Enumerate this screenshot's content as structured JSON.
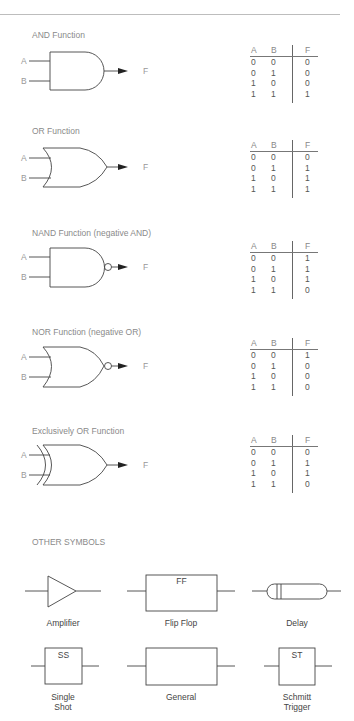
{
  "gates": [
    {
      "id": "and",
      "title": "AND Function",
      "input_a": "A",
      "input_b": "B",
      "output": "F",
      "table": {
        "headers": [
          "A",
          "B",
          "F"
        ],
        "rows": [
          [
            "0",
            "0",
            "0"
          ],
          [
            "0",
            "1",
            "0"
          ],
          [
            "1",
            "0",
            "0"
          ],
          [
            "1",
            "1",
            "1"
          ]
        ]
      }
    },
    {
      "id": "or",
      "title": "OR Function",
      "input_a": "A",
      "input_b": "B",
      "output": "F",
      "table": {
        "headers": [
          "A",
          "B",
          "F"
        ],
        "rows": [
          [
            "0",
            "0",
            "0"
          ],
          [
            "0",
            "1",
            "1"
          ],
          [
            "1",
            "0",
            "1"
          ],
          [
            "1",
            "1",
            "1"
          ]
        ]
      }
    },
    {
      "id": "nand",
      "title": "NAND Function (negative AND)",
      "input_a": "A",
      "input_b": "B",
      "output": "F",
      "table": {
        "headers": [
          "A",
          "B",
          "F"
        ],
        "rows": [
          [
            "0",
            "0",
            "1"
          ],
          [
            "0",
            "1",
            "1"
          ],
          [
            "1",
            "0",
            "1"
          ],
          [
            "1",
            "1",
            "0"
          ]
        ]
      }
    },
    {
      "id": "nor",
      "title": "NOR Function (negative OR)",
      "input_a": "A",
      "input_b": "B",
      "output": "F",
      "table": {
        "headers": [
          "A",
          "B",
          "F"
        ],
        "rows": [
          [
            "0",
            "0",
            "1"
          ],
          [
            "0",
            "1",
            "0"
          ],
          [
            "1",
            "0",
            "0"
          ],
          [
            "1",
            "1",
            "0"
          ]
        ]
      }
    },
    {
      "id": "xor",
      "title": "Exclusively OR Function",
      "input_a": "A",
      "input_b": "B",
      "output": "F",
      "table": {
        "headers": [
          "A",
          "B",
          "F"
        ],
        "rows": [
          [
            "0",
            "0",
            "0"
          ],
          [
            "0",
            "1",
            "1"
          ],
          [
            "1",
            "0",
            "1"
          ],
          [
            "1",
            "1",
            "0"
          ]
        ]
      }
    }
  ],
  "other": {
    "title": "OTHER SYMBOLS",
    "symbols": [
      {
        "id": "amplifier",
        "label": "Amplifier",
        "inner": ""
      },
      {
        "id": "flip-flop",
        "label": "Flip Flop",
        "inner": "FF"
      },
      {
        "id": "delay",
        "label": "Delay",
        "inner": ""
      },
      {
        "id": "single-shot",
        "label": "Single\nShot",
        "label_lines": [
          "Single",
          "Shot"
        ],
        "inner": "SS"
      },
      {
        "id": "general",
        "label": "General",
        "inner": ""
      },
      {
        "id": "schmitt-trigger",
        "label": "Schmitt\nTrigger",
        "label_lines": [
          "Schmitt",
          "Trigger"
        ],
        "inner": "ST"
      }
    ]
  }
}
